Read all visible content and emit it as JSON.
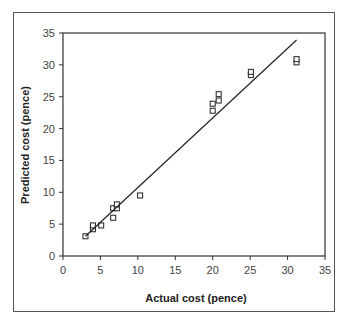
{
  "chart_data": {
    "type": "scatter",
    "title": "",
    "xlabel": "Actual cost (pence)",
    "ylabel": "Predicted cost (pence)",
    "xlim": [
      0,
      35
    ],
    "ylim": [
      0,
      35
    ],
    "x_ticks": [
      0,
      5,
      10,
      15,
      20,
      25,
      30,
      35
    ],
    "y_ticks": [
      0,
      5,
      10,
      15,
      20,
      25,
      30,
      35
    ],
    "grid": false,
    "legend": null,
    "series": [
      {
        "name": "Data points",
        "marker": "square-open",
        "points": [
          {
            "x": 3.0,
            "y": 3.1
          },
          {
            "x": 4.0,
            "y": 4.2
          },
          {
            "x": 4.0,
            "y": 4.8
          },
          {
            "x": 5.1,
            "y": 4.8
          },
          {
            "x": 6.7,
            "y": 6.0
          },
          {
            "x": 6.7,
            "y": 7.5
          },
          {
            "x": 7.2,
            "y": 7.5
          },
          {
            "x": 7.2,
            "y": 8.1
          },
          {
            "x": 10.3,
            "y": 9.5
          },
          {
            "x": 20.0,
            "y": 22.8
          },
          {
            "x": 20.0,
            "y": 23.9
          },
          {
            "x": 20.8,
            "y": 24.4
          },
          {
            "x": 20.8,
            "y": 25.4
          },
          {
            "x": 25.1,
            "y": 28.4
          },
          {
            "x": 25.1,
            "y": 28.9
          },
          {
            "x": 31.2,
            "y": 30.4
          },
          {
            "x": 31.2,
            "y": 30.9
          }
        ]
      },
      {
        "name": "Trend line",
        "type": "line",
        "points": [
          {
            "x": 3.0,
            "y": 3.1
          },
          {
            "x": 31.2,
            "y": 33.9
          }
        ]
      }
    ],
    "colors": {
      "marker": "#333333",
      "line": "#222222",
      "axis": "#333333",
      "frame": "#555555"
    }
  }
}
